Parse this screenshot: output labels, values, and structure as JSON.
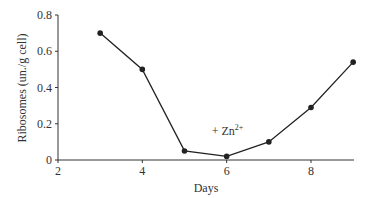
{
  "chart_data": {
    "type": "line",
    "title": "",
    "xlabel": "Days",
    "ylabel": "Ribosomes (un./g cell)",
    "xlim": [
      2,
      9.5
    ],
    "ylim": [
      0,
      0.8
    ],
    "xticks": [
      2,
      4,
      6,
      8
    ],
    "yticks": [
      0,
      0.2,
      0.4,
      0.6,
      0.8
    ],
    "xtick_labels": [
      "2",
      "4",
      "6",
      "8"
    ],
    "ytick_labels": [
      "0",
      "0.2",
      "0.4",
      "0.6",
      "0.8"
    ],
    "grid": false,
    "legend": null,
    "series": [
      {
        "name": "Ribosomes",
        "x": [
          3,
          4,
          5,
          6,
          7,
          8,
          9
        ],
        "values": [
          0.7,
          0.5,
          0.05,
          0.02,
          0.1,
          0.29,
          0.54
        ],
        "color": "#222222",
        "marker": "circle"
      }
    ],
    "annotations": [
      {
        "text": "+ Zn",
        "superscript": "2+",
        "x": 6,
        "y": 0.16
      }
    ]
  }
}
